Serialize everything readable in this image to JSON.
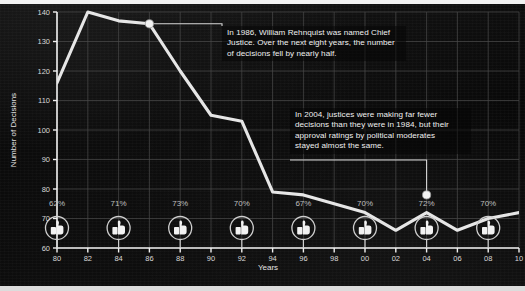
{
  "chart_data": {
    "type": "line",
    "title": "",
    "xlabel": "Years",
    "ylabel": "Number of Decisions",
    "xlim": [
      80,
      110
    ],
    "ylim": [
      60,
      140
    ],
    "grid": true,
    "legend": "none",
    "x_tick_labels": [
      "80",
      "82",
      "84",
      "86",
      "88",
      "90",
      "92",
      "94",
      "96",
      "98",
      "00",
      "02",
      "04",
      "06",
      "08",
      "10"
    ],
    "x_tick_values": [
      80,
      82,
      84,
      86,
      88,
      90,
      92,
      94,
      96,
      98,
      100,
      102,
      104,
      106,
      108,
      110
    ],
    "y_tick_labels": [
      "60",
      "70",
      "80",
      "90",
      "100",
      "110",
      "120",
      "130",
      "140"
    ],
    "y_tick_values": [
      60,
      70,
      80,
      90,
      100,
      110,
      120,
      130,
      140
    ],
    "series": [
      {
        "name": "Number of Decisions",
        "x": [
          80,
          82,
          84,
          86,
          88,
          90,
          92,
          94,
          96,
          98,
          100,
          102,
          104,
          106,
          108,
          110
        ],
        "values": [
          116,
          140,
          137,
          136,
          120,
          105,
          103,
          79,
          78,
          75,
          72,
          66,
          72,
          66,
          70,
          72
        ]
      }
    ],
    "markers": [
      {
        "x": 86,
        "y": 136,
        "label": "1986-marker"
      },
      {
        "x": 104,
        "y": 78,
        "label": "2004-marker"
      }
    ],
    "approval_ratings": {
      "label": "approval ratings by political moderates",
      "points": [
        {
          "x": 80,
          "value": "62%"
        },
        {
          "x": 84,
          "value": "71%"
        },
        {
          "x": 88,
          "value": "73%"
        },
        {
          "x": 92,
          "value": "70%"
        },
        {
          "x": 96,
          "value": "67%"
        },
        {
          "x": 100,
          "value": "70%"
        },
        {
          "x": 104,
          "value": "72%"
        },
        {
          "x": 108,
          "value": "70%"
        }
      ],
      "icon": "thumbs-up-icon"
    },
    "annotations": [
      {
        "id": "annotation-1986",
        "anchor_x": 86,
        "anchor_y": 136,
        "lines": [
          "In 1986, William Rehnquist was named Chief",
          "Justice. Over the next eight years, the number",
          "of decisions fell by nearly half."
        ]
      },
      {
        "id": "annotation-2004",
        "anchor_x": 104,
        "anchor_y": 78,
        "lines": [
          "In 2004, justices were making far fewer",
          "decisions than they were in 1984, but their",
          "approval ratings by political moderates",
          "stayed almost the same."
        ]
      }
    ],
    "colors": {
      "line": "#e6e6e6",
      "grid": "#4a4a4a",
      "axis": "#f0f0f0",
      "text": "#e8e8e8",
      "background": "#0a0a0a"
    }
  }
}
